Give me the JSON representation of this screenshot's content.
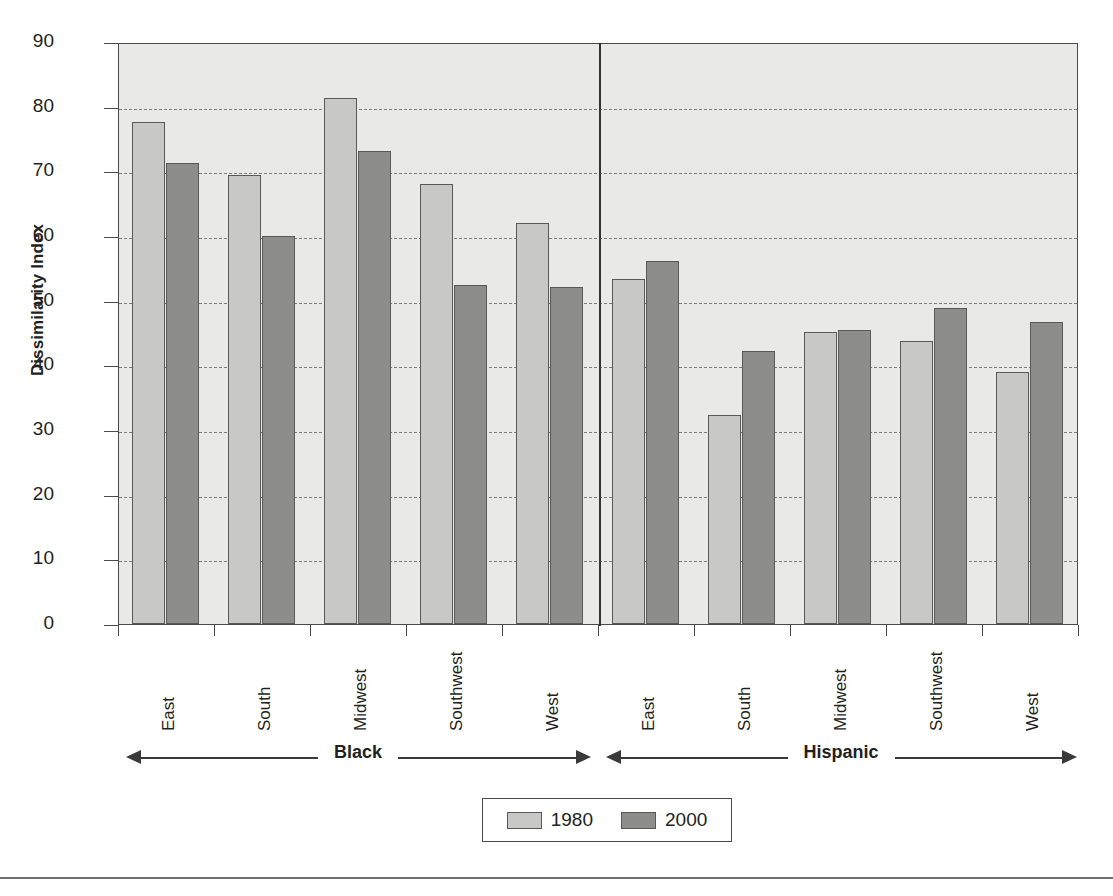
{
  "chart_data": {
    "type": "bar",
    "title": "",
    "xlabel": "",
    "ylabel": "Dissimilarity Index",
    "ylim": [
      0,
      90
    ],
    "yticks": [
      0,
      10,
      20,
      30,
      40,
      50,
      60,
      70,
      80,
      90
    ],
    "grid": true,
    "legend_position": "bottom",
    "categories": [
      "East",
      "South",
      "Midwest",
      "Southwest",
      "West",
      "East",
      "South",
      "Midwest",
      "Southwest",
      "West"
    ],
    "group_labels": [
      "Black",
      "Hispanic"
    ],
    "series": [
      {
        "name": "1980",
        "color": "#c8c8c6",
        "values": [
          77.6,
          69.5,
          81.3,
          68.1,
          62.0,
          53.4,
          32.3,
          45.2,
          43.8,
          39.0
        ]
      },
      {
        "name": "2000",
        "color": "#8d8d8b",
        "values": [
          71.3,
          60.0,
          73.1,
          52.4,
          52.1,
          56.2,
          42.2,
          45.4,
          48.8,
          46.7
        ]
      }
    ],
    "groups": [
      {
        "label": "Black",
        "categories": [
          "East",
          "South",
          "Midwest",
          "Southwest",
          "West"
        ],
        "1980": [
          77.6,
          69.5,
          81.3,
          68.1,
          62.0
        ],
        "2000": [
          71.3,
          60.0,
          73.1,
          52.4,
          52.1
        ]
      },
      {
        "label": "Hispanic",
        "categories": [
          "East",
          "South",
          "Midwest",
          "Southwest",
          "West"
        ],
        "1980": [
          53.4,
          32.3,
          45.2,
          43.8,
          39.0
        ],
        "2000": [
          56.2,
          42.2,
          45.4,
          48.8,
          46.7
        ]
      }
    ]
  },
  "axis": {
    "y_title": "Dissimilarity Index",
    "y_tick_labels": [
      "90",
      "80",
      "70",
      "60",
      "50",
      "40",
      "30",
      "20",
      "10",
      "0"
    ]
  },
  "legend": {
    "items": [
      {
        "label": "1980",
        "color": "#c8c8c6"
      },
      {
        "label": "2000",
        "color": "#8d8d8b"
      }
    ]
  },
  "groups": {
    "left": {
      "name": "Black"
    },
    "right": {
      "name": "Hispanic"
    }
  },
  "labels": {
    "c0": "East",
    "c1": "South",
    "c2": "Midwest",
    "c3": "Southwest",
    "c4": "West",
    "c5": "East",
    "c6": "South",
    "c7": "Midwest",
    "c8": "Southwest",
    "c9": "West"
  },
  "colors": {
    "series_1980": "#c8c8c6",
    "series_2000": "#8d8d8b",
    "plot_background": "#e9e9e7",
    "axis_line": "#4a4a4a",
    "grid_line": "#7d7d7d"
  }
}
